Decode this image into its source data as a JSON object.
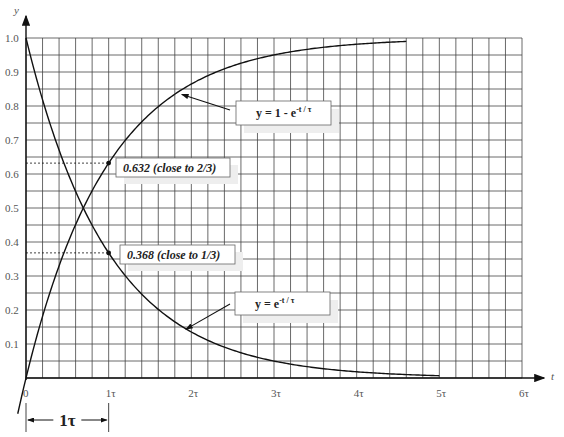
{
  "chart_data": {
    "type": "line",
    "title": "",
    "xlabel": "t",
    "ylabel": "y",
    "xlim": [
      0,
      6
    ],
    "ylim": [
      0,
      1.0
    ],
    "grid": true,
    "grid_minor_x_step": 0.2,
    "grid_minor_y_step": 0.05,
    "x_ticks": [
      {
        "value": 0,
        "label": "0"
      },
      {
        "value": 1,
        "label": "1τ"
      },
      {
        "value": 2,
        "label": "2τ"
      },
      {
        "value": 3,
        "label": "3τ"
      },
      {
        "value": 4,
        "label": "4τ"
      },
      {
        "value": 5,
        "label": "5τ"
      },
      {
        "value": 6,
        "label": "6τ"
      }
    ],
    "y_ticks": [
      {
        "value": 0.1,
        "label": "0.1"
      },
      {
        "value": 0.2,
        "label": "0.2"
      },
      {
        "value": 0.3,
        "label": "0.3"
      },
      {
        "value": 0.4,
        "label": "0.4"
      },
      {
        "value": 0.5,
        "label": "0.5"
      },
      {
        "value": 0.6,
        "label": "0.6"
      },
      {
        "value": 0.7,
        "label": "0.7"
      },
      {
        "value": 0.8,
        "label": "0.8"
      },
      {
        "value": 0.9,
        "label": "0.9"
      },
      {
        "value": 1.0,
        "label": "1.0"
      }
    ],
    "series": [
      {
        "name": "rise",
        "function": "1 - exp(-t/tau)",
        "x_range": [
          -0.1,
          4.6
        ],
        "formula_main": "y = 1 - e",
        "formula_sup": "-t / τ",
        "label_anchor_t": 1.85
      },
      {
        "name": "decay",
        "function": "exp(-t/tau)",
        "x_range": [
          0,
          5.0
        ],
        "formula_main": "y = e",
        "formula_sup": "-t / τ",
        "label_anchor_t": 1.9
      }
    ],
    "annotations": [
      {
        "t": 1,
        "y": 0.632,
        "text": "0.632 (close to 2/3)",
        "dashed_to_axis": true
      },
      {
        "t": 1,
        "y": 0.368,
        "text": "0.368 (close to 1/3)",
        "dashed_to_axis": true
      }
    ],
    "bracket": {
      "from": 0,
      "to": 1,
      "label": "1τ"
    }
  }
}
